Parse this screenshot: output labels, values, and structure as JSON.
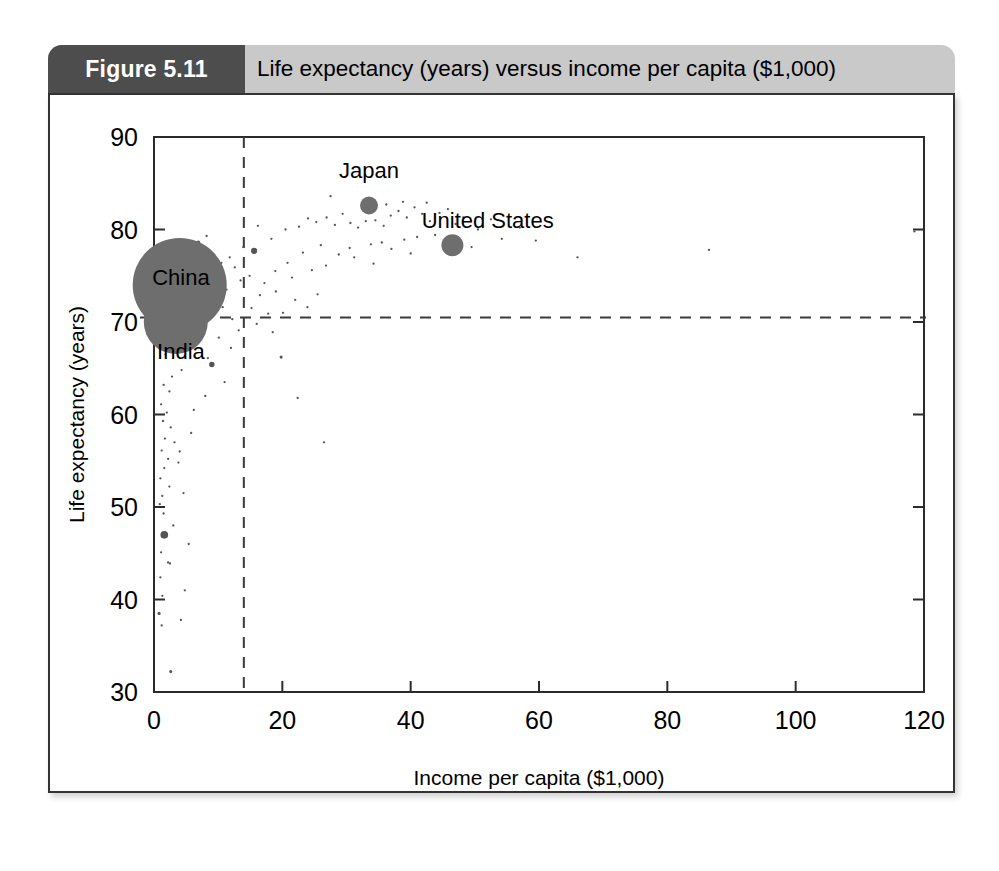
{
  "figure": {
    "number_label": "Figure 5.11",
    "caption": "Life expectancy (years) versus income per capita ($1,000)",
    "header_bg": "#c9c9c9",
    "number_box_bg": "#4d4d4d",
    "number_text_color": "#ffffff",
    "border_color": "#333333"
  },
  "chart_data": {
    "type": "scatter",
    "title": "Life expectancy (years) versus income per capita ($1,000)",
    "xlabel": "Income per capita ($1,000)",
    "ylabel": "Life expectancy (years)",
    "xlim": [
      0,
      120
    ],
    "ylim": [
      30,
      90
    ],
    "xticks": [
      0,
      20,
      40,
      60,
      80,
      100,
      120
    ],
    "yticks": [
      30,
      40,
      50,
      60,
      70,
      80,
      90
    ],
    "xtick_labels": [
      "0",
      "20",
      "40",
      "60",
      "80",
      "100",
      "120"
    ],
    "ytick_labels": [
      "30",
      "40",
      "50",
      "60",
      "70",
      "80",
      "90"
    ],
    "grid": false,
    "legend": null,
    "marker_color": "#6e6e6e",
    "reference_lines": [
      {
        "orientation": "horizontal",
        "value": 70.5,
        "style": "dashed",
        "label": "world average life expectancy"
      },
      {
        "orientation": "vertical",
        "value": 14.0,
        "style": "dashed",
        "label": "world average income per capita"
      }
    ],
    "annotations": [
      {
        "text": "China",
        "x": 4.2,
        "y": 74.0
      },
      {
        "text": "India",
        "x": 4.2,
        "y": 66.0
      },
      {
        "text": "Japan",
        "x": 33.5,
        "y": 85.6
      },
      {
        "text": "United States",
        "x": 52.0,
        "y": 80.2
      }
    ],
    "labeled_points": [
      {
        "name": "China",
        "x": 4.0,
        "y": 74.0,
        "size": 47
      },
      {
        "name": "India",
        "x": 3.4,
        "y": 70.0,
        "size": 32
      },
      {
        "name": "Japan",
        "x": 33.5,
        "y": 82.6,
        "size": 9
      },
      {
        "name": "United States",
        "x": 46.5,
        "y": 78.3,
        "size": 11
      }
    ],
    "points": [
      {
        "x": 1.2,
        "y": 77.6,
        "size": 3
      },
      {
        "x": 6.9,
        "y": 78.6,
        "size": 5
      },
      {
        "x": 8.2,
        "y": 79.3,
        "size": 3
      },
      {
        "x": 2.1,
        "y": 76.9,
        "size": 3
      },
      {
        "x": 9.6,
        "y": 72.2,
        "size": 7
      },
      {
        "x": 15.6,
        "y": 77.7,
        "size": 8
      },
      {
        "x": 9.0,
        "y": 65.4,
        "size": 7
      },
      {
        "x": 5.5,
        "y": 75.8,
        "size": 3
      },
      {
        "x": 6.4,
        "y": 75.1,
        "size": 3
      },
      {
        "x": 7.6,
        "y": 74.4,
        "size": 3
      },
      {
        "x": 8.9,
        "y": 74.1,
        "size": 3
      },
      {
        "x": 9.8,
        "y": 73.1,
        "size": 3
      },
      {
        "x": 10.7,
        "y": 71.6,
        "size": 3
      },
      {
        "x": 11.3,
        "y": 73.5,
        "size": 3
      },
      {
        "x": 7.2,
        "y": 71.2,
        "size": 3
      },
      {
        "x": 6.1,
        "y": 69.3,
        "size": 3
      },
      {
        "x": 10.1,
        "y": 68.3,
        "size": 3
      },
      {
        "x": 12.0,
        "y": 67.2,
        "size": 3
      },
      {
        "x": 8.4,
        "y": 66.1,
        "size": 3
      },
      {
        "x": 5.0,
        "y": 67.5,
        "size": 3
      },
      {
        "x": 4.3,
        "y": 64.8,
        "size": 3
      },
      {
        "x": 2.8,
        "y": 64.1,
        "size": 3
      },
      {
        "x": 1.8,
        "y": 66.5,
        "size": 3
      },
      {
        "x": 1.5,
        "y": 63.2,
        "size": 3
      },
      {
        "x": 2.4,
        "y": 62.5,
        "size": 3
      },
      {
        "x": 1.1,
        "y": 61.1,
        "size": 3
      },
      {
        "x": 2.0,
        "y": 60.2,
        "size": 3
      },
      {
        "x": 1.4,
        "y": 59.3,
        "size": 3
      },
      {
        "x": 2.6,
        "y": 58.6,
        "size": 3
      },
      {
        "x": 1.7,
        "y": 57.4,
        "size": 3
      },
      {
        "x": 3.2,
        "y": 57.0,
        "size": 3
      },
      {
        "x": 1.2,
        "y": 56.1,
        "size": 3
      },
      {
        "x": 2.2,
        "y": 55.2,
        "size": 3
      },
      {
        "x": 1.6,
        "y": 54.2,
        "size": 3
      },
      {
        "x": 3.8,
        "y": 54.8,
        "size": 3
      },
      {
        "x": 1.0,
        "y": 53.1,
        "size": 3
      },
      {
        "x": 2.4,
        "y": 52.2,
        "size": 3
      },
      {
        "x": 1.3,
        "y": 51.2,
        "size": 3
      },
      {
        "x": 0.9,
        "y": 50.3,
        "size": 3
      },
      {
        "x": 4.6,
        "y": 51.5,
        "size": 3
      },
      {
        "x": 1.5,
        "y": 49.3,
        "size": 3
      },
      {
        "x": 1.6,
        "y": 47.0,
        "size": 10
      },
      {
        "x": 1.1,
        "y": 45.1,
        "size": 3
      },
      {
        "x": 2.5,
        "y": 43.9,
        "size": 3
      },
      {
        "x": 1.0,
        "y": 42.4,
        "size": 3
      },
      {
        "x": 1.3,
        "y": 40.4,
        "size": 3
      },
      {
        "x": 0.8,
        "y": 38.5,
        "size": 4
      },
      {
        "x": 1.2,
        "y": 37.2,
        "size": 3
      },
      {
        "x": 4.2,
        "y": 37.8,
        "size": 3
      },
      {
        "x": 2.6,
        "y": 32.2,
        "size": 4
      },
      {
        "x": 16.2,
        "y": 80.4,
        "size": 3
      },
      {
        "x": 18.3,
        "y": 79.0,
        "size": 3
      },
      {
        "x": 20.5,
        "y": 80.0,
        "size": 3
      },
      {
        "x": 22.6,
        "y": 80.3,
        "size": 3
      },
      {
        "x": 24.0,
        "y": 81.2,
        "size": 3
      },
      {
        "x": 25.3,
        "y": 80.8,
        "size": 3
      },
      {
        "x": 26.9,
        "y": 81.3,
        "size": 3
      },
      {
        "x": 28.2,
        "y": 80.5,
        "size": 3
      },
      {
        "x": 29.4,
        "y": 81.7,
        "size": 3
      },
      {
        "x": 27.5,
        "y": 83.6,
        "size": 3
      },
      {
        "x": 30.6,
        "y": 80.7,
        "size": 3
      },
      {
        "x": 31.8,
        "y": 80.2,
        "size": 3
      },
      {
        "x": 33.0,
        "y": 80.9,
        "size": 3
      },
      {
        "x": 34.5,
        "y": 81.0,
        "size": 3
      },
      {
        "x": 35.8,
        "y": 80.4,
        "size": 3
      },
      {
        "x": 36.9,
        "y": 81.5,
        "size": 3
      },
      {
        "x": 38.1,
        "y": 82.0,
        "size": 3
      },
      {
        "x": 39.4,
        "y": 81.3,
        "size": 3
      },
      {
        "x": 40.6,
        "y": 82.4,
        "size": 3
      },
      {
        "x": 41.8,
        "y": 81.7,
        "size": 3
      },
      {
        "x": 43.0,
        "y": 80.9,
        "size": 3
      },
      {
        "x": 44.5,
        "y": 81.8,
        "size": 3
      },
      {
        "x": 36.2,
        "y": 82.7,
        "size": 3
      },
      {
        "x": 38.8,
        "y": 83.0,
        "size": 3
      },
      {
        "x": 42.5,
        "y": 82.9,
        "size": 3
      },
      {
        "x": 45.8,
        "y": 82.2,
        "size": 3
      },
      {
        "x": 48.2,
        "y": 81.3,
        "size": 3
      },
      {
        "x": 50.5,
        "y": 80.0,
        "size": 3
      },
      {
        "x": 54.2,
        "y": 79.0,
        "size": 3
      },
      {
        "x": 59.5,
        "y": 78.8,
        "size": 3
      },
      {
        "x": 66.0,
        "y": 77.0,
        "size": 3
      },
      {
        "x": 86.5,
        "y": 77.8,
        "size": 3
      },
      {
        "x": 118.5,
        "y": 79.8,
        "size": 3
      },
      {
        "x": 30.5,
        "y": 78.0,
        "size": 3
      },
      {
        "x": 33.8,
        "y": 78.4,
        "size": 3
      },
      {
        "x": 35.5,
        "y": 78.6,
        "size": 3
      },
      {
        "x": 37.0,
        "y": 77.9,
        "size": 3
      },
      {
        "x": 39.0,
        "y": 78.9,
        "size": 3
      },
      {
        "x": 41.0,
        "y": 79.2,
        "size": 3
      },
      {
        "x": 28.8,
        "y": 77.3,
        "size": 3
      },
      {
        "x": 26.0,
        "y": 78.3,
        "size": 3
      },
      {
        "x": 23.2,
        "y": 77.5,
        "size": 3
      },
      {
        "x": 20.8,
        "y": 76.4,
        "size": 3
      },
      {
        "x": 18.9,
        "y": 75.5,
        "size": 3
      },
      {
        "x": 17.2,
        "y": 74.2,
        "size": 3
      },
      {
        "x": 21.5,
        "y": 74.8,
        "size": 3
      },
      {
        "x": 24.6,
        "y": 75.6,
        "size": 3
      },
      {
        "x": 26.8,
        "y": 76.1,
        "size": 3
      },
      {
        "x": 16.5,
        "y": 72.9,
        "size": 3
      },
      {
        "x": 19.0,
        "y": 73.3,
        "size": 3
      },
      {
        "x": 22.0,
        "y": 72.4,
        "size": 3
      },
      {
        "x": 25.5,
        "y": 73.0,
        "size": 3
      },
      {
        "x": 15.2,
        "y": 71.5,
        "size": 3
      },
      {
        "x": 17.8,
        "y": 70.9,
        "size": 3
      },
      {
        "x": 20.1,
        "y": 71.0,
        "size": 3
      },
      {
        "x": 23.9,
        "y": 71.6,
        "size": 3
      },
      {
        "x": 16.0,
        "y": 69.8,
        "size": 3
      },
      {
        "x": 18.5,
        "y": 68.9,
        "size": 3
      },
      {
        "x": 19.8,
        "y": 66.2,
        "size": 4
      },
      {
        "x": 22.4,
        "y": 61.8,
        "size": 3
      },
      {
        "x": 26.5,
        "y": 57.0,
        "size": 3
      },
      {
        "x": 14.9,
        "y": 75.0,
        "size": 3
      },
      {
        "x": 13.5,
        "y": 74.5,
        "size": 3
      },
      {
        "x": 12.6,
        "y": 75.9,
        "size": 3
      },
      {
        "x": 11.8,
        "y": 77.0,
        "size": 3
      },
      {
        "x": 13.9,
        "y": 78.1,
        "size": 3
      },
      {
        "x": 10.5,
        "y": 76.4,
        "size": 3
      },
      {
        "x": 12.2,
        "y": 70.3,
        "size": 3
      },
      {
        "x": 13.2,
        "y": 69.1,
        "size": 3
      },
      {
        "x": 11.0,
        "y": 63.5,
        "size": 3
      },
      {
        "x": 8.0,
        "y": 62.0,
        "size": 3
      },
      {
        "x": 6.2,
        "y": 60.5,
        "size": 3
      },
      {
        "x": 5.8,
        "y": 58.0,
        "size": 3
      },
      {
        "x": 4.0,
        "y": 56.0,
        "size": 3
      },
      {
        "x": 3.0,
        "y": 48.0,
        "size": 3
      },
      {
        "x": 5.4,
        "y": 46.0,
        "size": 3
      },
      {
        "x": 2.2,
        "y": 44.0,
        "size": 3
      },
      {
        "x": 4.8,
        "y": 41.0,
        "size": 3
      },
      {
        "x": 47.0,
        "y": 80.6,
        "size": 3
      },
      {
        "x": 52.5,
        "y": 81.1,
        "size": 3
      },
      {
        "x": 57.0,
        "y": 80.2,
        "size": 3
      },
      {
        "x": 43.8,
        "y": 79.4,
        "size": 3
      },
      {
        "x": 49.5,
        "y": 78.1,
        "size": 3
      },
      {
        "x": 31.2,
        "y": 77.0,
        "size": 3
      },
      {
        "x": 34.2,
        "y": 76.3,
        "size": 3
      },
      {
        "x": 40.0,
        "y": 77.4,
        "size": 3
      }
    ]
  }
}
